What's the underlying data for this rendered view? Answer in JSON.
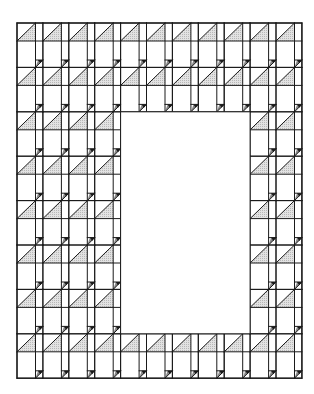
{
  "diagram": {
    "type": "quilt-block-pattern",
    "canvas": {
      "width": 314,
      "height": 394
    },
    "origin": {
      "x": 17,
      "y": 23
    },
    "columns": 11,
    "bands": 8,
    "unit": {
      "wide_width": 18.5,
      "narrow_width": 7.4,
      "triangle_row_height": 18,
      "plain_row_height": 26.4
    },
    "hole": {
      "col_start": 4,
      "col_end": 8,
      "band_start": 2,
      "band_end": 6
    },
    "colors": {
      "line": "#1a1a1a",
      "shade": "#cfcfcf",
      "flag_shade": "#8a8a8a",
      "background": "#ffffff"
    }
  }
}
